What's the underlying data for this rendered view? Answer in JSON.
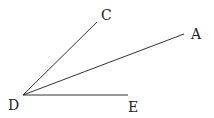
{
  "diagram": {
    "type": "geometry-angles",
    "points": {
      "D": {
        "label": "D",
        "x": 23,
        "y": 95,
        "lx": 8,
        "ly": 110
      },
      "C": {
        "label": "C",
        "x": 97,
        "y": 22,
        "lx": 101,
        "ly": 20
      },
      "A": {
        "label": "A",
        "x": 184,
        "y": 34,
        "lx": 191,
        "ly": 39
      },
      "E": {
        "label": "E",
        "x": 128,
        "y": 95,
        "lx": 128,
        "ly": 112
      }
    },
    "segments": [
      [
        "D",
        "C"
      ],
      [
        "D",
        "A"
      ],
      [
        "D",
        "E"
      ]
    ],
    "stroke_color": "#333333"
  }
}
